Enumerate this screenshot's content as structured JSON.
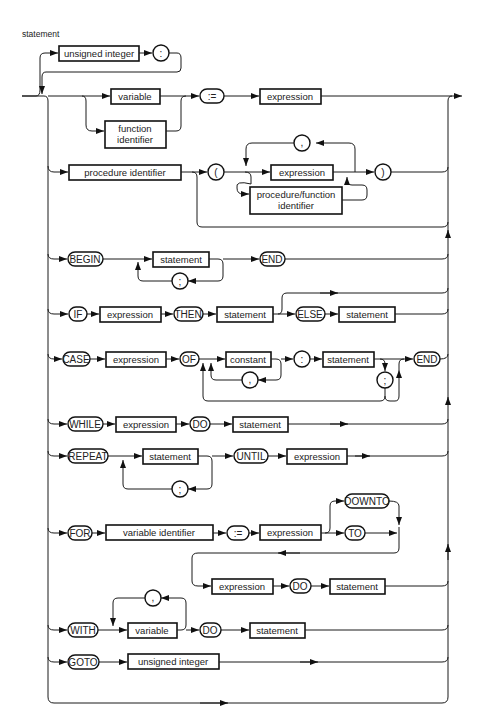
{
  "diagram": {
    "title": "statement",
    "label_prefix": {
      "box_unsigned_integer": "unsigned integer",
      "colon": ":"
    },
    "assignment": {
      "variable": "variable",
      "function_identifier_1": "function",
      "function_identifier_2": "identifier",
      "assign": ":=",
      "expression": "expression"
    },
    "procedure_call": {
      "procedure_identifier": "procedure identifier",
      "lparen": "(",
      "comma": ",",
      "expression": "expression",
      "proc_func_1": "procedure/function",
      "proc_func_2": "identifier",
      "rparen": ")"
    },
    "compound": {
      "begin": "BEGIN",
      "statement": "statement",
      "semicolon": ";",
      "end": "END"
    },
    "if_stmt": {
      "if": "IF",
      "expression": "expression",
      "then": "THEN",
      "statement": "statement",
      "else": "ELSE",
      "else_statement": "statement"
    },
    "case_stmt": {
      "case": "CASE",
      "expression": "expression",
      "of": "OF",
      "constant": "constant",
      "comma": ",",
      "colon": ":",
      "statement": "statement",
      "semicolon": ";",
      "end": "END"
    },
    "while_stmt": {
      "while": "WHILE",
      "expression": "expression",
      "do": "DO",
      "statement": "statement"
    },
    "repeat_stmt": {
      "repeat": "REPEAT",
      "statement": "statement",
      "semicolon": ";",
      "until": "UNTIL",
      "expression": "expression"
    },
    "for_stmt": {
      "for": "FOR",
      "variable_identifier": "variable identifier",
      "assign": ":=",
      "expression": "expression",
      "downto": "DOWNTO",
      "to": "TO",
      "expression2": "expression",
      "do": "DO",
      "statement": "statement"
    },
    "with_stmt": {
      "with": "WITH",
      "comma": ",",
      "variable": "variable",
      "do": "DO",
      "statement": "statement"
    },
    "goto_stmt": {
      "goto": "GOTO",
      "unsigned_integer": "unsigned integer"
    }
  }
}
